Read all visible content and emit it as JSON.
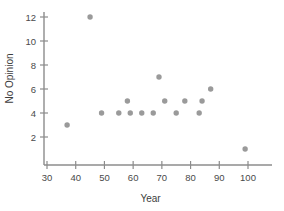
{
  "chart_data": {
    "type": "scatter",
    "title": "",
    "xlabel": "Year",
    "ylabel": "No Opinion",
    "xlim": [
      28,
      106
    ],
    "ylim": [
      0,
      13
    ],
    "xticks": [
      30,
      40,
      50,
      60,
      70,
      80,
      90,
      100
    ],
    "yticks": [
      2,
      4,
      6,
      8,
      10,
      12
    ],
    "xtick_labels": [
      "30",
      "40",
      "50",
      "60",
      "70",
      "80",
      "90",
      "100"
    ],
    "ytick_labels": [
      "2",
      "4",
      "6",
      "8",
      "10",
      "12"
    ],
    "grid": false,
    "legend": false,
    "marker_color": "#9a9a9a",
    "axis_color": "#8c8c8c",
    "points": [
      {
        "x": 37,
        "y": 3
      },
      {
        "x": 45,
        "y": 12
      },
      {
        "x": 49,
        "y": 4
      },
      {
        "x": 55,
        "y": 4
      },
      {
        "x": 58,
        "y": 5
      },
      {
        "x": 59,
        "y": 4
      },
      {
        "x": 63,
        "y": 4
      },
      {
        "x": 67,
        "y": 4
      },
      {
        "x": 69,
        "y": 7
      },
      {
        "x": 71,
        "y": 5
      },
      {
        "x": 75,
        "y": 4
      },
      {
        "x": 78,
        "y": 5
      },
      {
        "x": 83,
        "y": 4
      },
      {
        "x": 84,
        "y": 5
      },
      {
        "x": 87,
        "y": 6
      },
      {
        "x": 99,
        "y": 1
      }
    ]
  }
}
